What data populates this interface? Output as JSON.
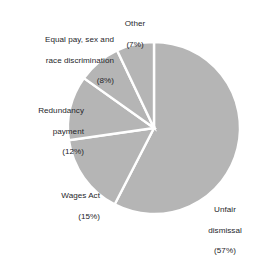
{
  "chart_data": {
    "type": "pie",
    "title": "",
    "subtitle": "",
    "xlabel": "",
    "ylabel": "",
    "grid": false,
    "legend": "none",
    "value_unit": "%",
    "start_angle_deg": 0,
    "direction": "clockwise",
    "fill_color": "#b5b5b5",
    "divider_color": "#ffffff",
    "background_color": "#ffffff",
    "label_color": "#26262a",
    "categories": [
      "Unfair dismissal",
      "Wages Act",
      "Redundancy payment",
      "Equal pay, sex and race discrimination",
      "Other"
    ],
    "values": [
      57,
      15,
      12,
      8,
      7
    ],
    "slices": [
      {
        "key": "unfair-dismissal",
        "name_line_1": "Unfair",
        "name_line_2": "dismissal",
        "percent_text": "(57%)",
        "value": 57
      },
      {
        "key": "wages-act",
        "name_line_1": "Wages Act",
        "name_line_2": "",
        "percent_text": "(15%)",
        "value": 15
      },
      {
        "key": "redundancy-payment",
        "name_line_1": "Redundancy",
        "name_line_2": "payment",
        "percent_text": "(12%)",
        "value": 12
      },
      {
        "key": "equal-pay-sex-race-discrimination",
        "name_line_1": "Equal pay, sex and",
        "name_line_2": "race discrimination",
        "percent_text": "(8%)",
        "value": 8
      },
      {
        "key": "other",
        "name_line_1": "Other",
        "name_line_2": "",
        "percent_text": "(7%)",
        "value": 7
      }
    ]
  }
}
